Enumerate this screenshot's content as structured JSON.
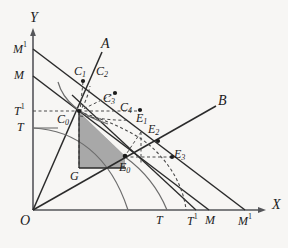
{
  "figure": {
    "kind": "economics-geometry-diagram",
    "background_color": "#f7f6f4",
    "ink_color": "#1b1b1b",
    "shaded_fill": "#a8a8a8",
    "axes": {
      "x_label": "X",
      "y_label": "Y",
      "origin_label": "O"
    },
    "rays": [
      {
        "name": "A",
        "label": "A"
      },
      {
        "name": "B",
        "label": "B"
      }
    ],
    "y_axis_ticks": [
      {
        "label_base": "M",
        "label_sup": "1"
      },
      {
        "label_base": "M",
        "label_sup": ""
      },
      {
        "label_base": "T",
        "label_sup": "1"
      },
      {
        "label_base": "T",
        "label_sup": ""
      }
    ],
    "x_axis_ticks": [
      {
        "label_base": "T",
        "label_sup": ""
      },
      {
        "label_base": "T",
        "label_sup": "1"
      },
      {
        "label_base": "M",
        "label_sup": ""
      },
      {
        "label_base": "M",
        "label_sup": "1"
      }
    ],
    "points": [
      {
        "base": "C",
        "sub": "0"
      },
      {
        "base": "C",
        "sub": "1"
      },
      {
        "base": "C",
        "sub": "2"
      },
      {
        "base": "C",
        "sub": "3"
      },
      {
        "base": "C",
        "sub": "4"
      },
      {
        "base": "E",
        "sub": "0"
      },
      {
        "base": "E",
        "sub": "1"
      },
      {
        "base": "E",
        "sub": "2"
      },
      {
        "base": "E",
        "sub": "3"
      },
      {
        "base": "G",
        "sub": ""
      }
    ]
  }
}
